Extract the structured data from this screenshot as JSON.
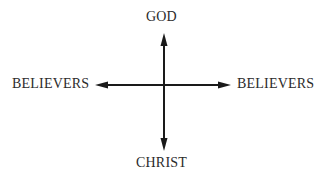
{
  "diagram": {
    "labels": {
      "top": "GOD",
      "left": "BELIEVERS",
      "right": "BELIEVERS",
      "bottom": "CHRIST"
    },
    "axes": {
      "vertical": {
        "x": 164,
        "y_top": 33,
        "y_bottom": 151
      },
      "horizontal": {
        "y": 85,
        "x_left": 95,
        "x_right": 231
      }
    },
    "colors": {
      "line": "#1a1a1a",
      "text": "#2b2b2b"
    }
  }
}
